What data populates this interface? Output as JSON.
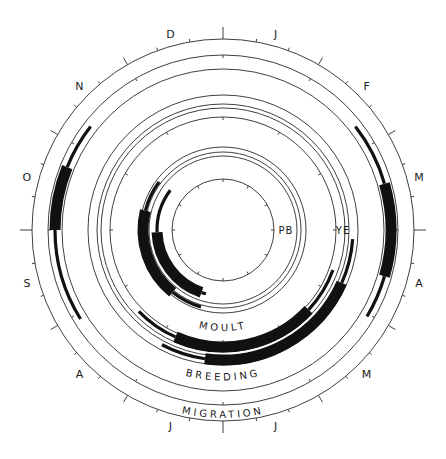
{
  "diagram": {
    "center": [
      223,
      230
    ],
    "outer_radius": 191,
    "month_labels": [
      "J",
      "F",
      "M",
      "A",
      "M",
      "J",
      "J",
      "A",
      "S",
      "O",
      "N",
      "D"
    ],
    "month_label_radius": 203,
    "ring_labels": {
      "moult": "MOULT",
      "breeding": "BREEDING",
      "migration": "MIGRATION"
    },
    "species_labels": [
      {
        "text": "PB",
        "angle": 90,
        "radius": 65
      },
      {
        "text": "YE",
        "angle": 90,
        "radius": 120
      }
    ],
    "rings": {
      "outer": 191,
      "migration": [
        175,
        161
      ],
      "breeding": [
        135,
        126,
        122,
        113
      ],
      "moult": [
        83,
        78,
        74,
        51
      ]
    },
    "bars_color": "#111111",
    "bars": [
      {
        "group": "migration",
        "species": "YE",
        "radius": 168,
        "thin": [
          52,
          74
        ],
        "thick": [
          74,
          106
        ],
        "thin_end": [
          106,
          121
        ]
      },
      {
        "group": "migration",
        "species": "YE",
        "radius": 168,
        "thin": [
          238,
          270
        ],
        "thick": [
          270,
          292
        ],
        "thin_end": [
          292,
          308
        ]
      },
      {
        "group": "breeding",
        "species": "YE",
        "radius": 130,
        "thin": [
          94,
          114
        ],
        "thick": [
          114,
          188
        ],
        "thin_end": [
          188,
          208
        ]
      },
      {
        "group": "breeding",
        "species": "PB",
        "radius": 117,
        "thin": [
          110,
          133
        ],
        "thick": [
          133,
          204
        ],
        "thin_end": [
          204,
          226
        ]
      },
      {
        "group": "moult",
        "species": "YE",
        "radius": 80,
        "thin": [
          196,
          219
        ],
        "thick": [
          219,
          284
        ],
        "thin_end": [
          284,
          307
        ]
      },
      {
        "group": "moult",
        "species": "PB",
        "radius": 66,
        "thin": [
          195,
          199
        ],
        "thick": [
          199,
          268
        ],
        "thin_end": [
          268,
          307
        ]
      }
    ]
  }
}
